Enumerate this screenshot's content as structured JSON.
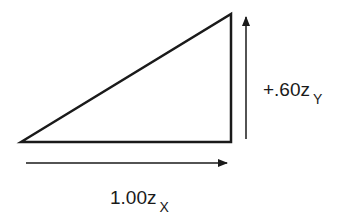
{
  "diagram": {
    "shape": "right-triangle",
    "colors": {
      "stroke": "#1a1a1a",
      "background": "#ffffff"
    },
    "vertical_vector": {
      "coefficient": "+.60",
      "variable": "z",
      "subscript": "Y"
    },
    "horizontal_vector": {
      "coefficient": "1.00",
      "variable": "z",
      "subscript": "X"
    }
  }
}
